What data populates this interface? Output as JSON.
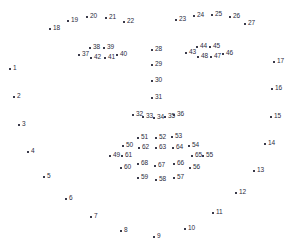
{
  "figure": {
    "width": 298,
    "height": 252,
    "background_color": "#ffffff",
    "marker_color": "#3a3a4a",
    "label_color": "#2b2b3d",
    "marker_glyph": "plus-marker"
  },
  "chart_data": {
    "type": "scatter",
    "xlabel": "",
    "ylabel": "",
    "grid": false,
    "legend": false,
    "xlim": [
      0,
      298
    ],
    "ylim": [
      0,
      252
    ],
    "groups": [
      {
        "name": "jaw-contour",
        "range": "1-17"
      },
      {
        "name": "left-eyebrow",
        "range": "18-22"
      },
      {
        "name": "right-eyebrow",
        "range": "23-27"
      },
      {
        "name": "nose-bridge",
        "range": "28-31"
      },
      {
        "name": "nose-base",
        "range": "32-36"
      },
      {
        "name": "left-eye",
        "range": "37-42"
      },
      {
        "name": "right-eye",
        "range": "43-48"
      },
      {
        "name": "outer-lip",
        "range": "49-60"
      },
      {
        "name": "inner-lip",
        "range": "61-68"
      }
    ],
    "points": [
      {
        "label": "1",
        "x": 10,
        "y": 69,
        "group": "jaw-contour"
      },
      {
        "label": "2",
        "x": 14,
        "y": 97,
        "group": "jaw-contour"
      },
      {
        "label": "3",
        "x": 19,
        "y": 125,
        "group": "jaw-contour"
      },
      {
        "label": "4",
        "x": 28,
        "y": 152,
        "group": "jaw-contour"
      },
      {
        "label": "5",
        "x": 44,
        "y": 177,
        "group": "jaw-contour"
      },
      {
        "label": "6",
        "x": 66,
        "y": 199,
        "group": "jaw-contour"
      },
      {
        "label": "7",
        "x": 91,
        "y": 217,
        "group": "jaw-contour"
      },
      {
        "label": "8",
        "x": 121,
        "y": 231,
        "group": "jaw-contour"
      },
      {
        "label": "9",
        "x": 154,
        "y": 237,
        "group": "jaw-contour"
      },
      {
        "label": "10",
        "x": 185,
        "y": 229,
        "group": "jaw-contour"
      },
      {
        "label": "11",
        "x": 213,
        "y": 213,
        "group": "jaw-contour"
      },
      {
        "label": "12",
        "x": 236,
        "y": 193,
        "group": "jaw-contour"
      },
      {
        "label": "13",
        "x": 254,
        "y": 171,
        "group": "jaw-contour"
      },
      {
        "label": "14",
        "x": 265,
        "y": 144,
        "group": "jaw-contour"
      },
      {
        "label": "15",
        "x": 271,
        "y": 117,
        "group": "jaw-contour"
      },
      {
        "label": "16",
        "x": 272,
        "y": 89,
        "group": "jaw-contour"
      },
      {
        "label": "17",
        "x": 274,
        "y": 62,
        "group": "jaw-contour"
      },
      {
        "label": "18",
        "x": 50,
        "y": 29,
        "group": "left-eyebrow"
      },
      {
        "label": "19",
        "x": 68,
        "y": 21,
        "group": "left-eyebrow"
      },
      {
        "label": "20",
        "x": 87,
        "y": 17,
        "group": "left-eyebrow"
      },
      {
        "label": "21",
        "x": 106,
        "y": 18,
        "group": "left-eyebrow"
      },
      {
        "label": "22",
        "x": 124,
        "y": 22,
        "group": "left-eyebrow"
      },
      {
        "label": "23",
        "x": 176,
        "y": 20,
        "group": "right-eyebrow"
      },
      {
        "label": "24",
        "x": 194,
        "y": 16,
        "group": "right-eyebrow"
      },
      {
        "label": "25",
        "x": 212,
        "y": 15,
        "group": "right-eyebrow"
      },
      {
        "label": "26",
        "x": 230,
        "y": 17,
        "group": "right-eyebrow"
      },
      {
        "label": "27",
        "x": 245,
        "y": 24,
        "group": "right-eyebrow"
      },
      {
        "label": "28",
        "x": 152,
        "y": 50,
        "group": "nose-bridge"
      },
      {
        "label": "29",
        "x": 152,
        "y": 65,
        "group": "nose-bridge"
      },
      {
        "label": "30",
        "x": 152,
        "y": 81,
        "group": "nose-bridge"
      },
      {
        "label": "31",
        "x": 152,
        "y": 98,
        "group": "nose-bridge"
      },
      {
        "label": "32",
        "x": 133,
        "y": 115,
        "group": "nose-base"
      },
      {
        "label": "33",
        "x": 143,
        "y": 117,
        "group": "nose-base"
      },
      {
        "label": "34",
        "x": 154,
        "y": 118,
        "group": "nose-base"
      },
      {
        "label": "35",
        "x": 165,
        "y": 117,
        "group": "nose-base"
      },
      {
        "label": "36",
        "x": 174,
        "y": 115,
        "group": "nose-base"
      },
      {
        "label": "37",
        "x": 79,
        "y": 55,
        "group": "left-eye"
      },
      {
        "label": "38",
        "x": 90,
        "y": 48,
        "group": "left-eye"
      },
      {
        "label": "39",
        "x": 104,
        "y": 48,
        "group": "left-eye"
      },
      {
        "label": "40",
        "x": 117,
        "y": 55,
        "group": "left-eye"
      },
      {
        "label": "41",
        "x": 105,
        "y": 58,
        "group": "left-eye"
      },
      {
        "label": "42",
        "x": 91,
        "y": 58,
        "group": "left-eye"
      },
      {
        "label": "43",
        "x": 186,
        "y": 53,
        "group": "right-eye"
      },
      {
        "label": "44",
        "x": 197,
        "y": 47,
        "group": "right-eye"
      },
      {
        "label": "45",
        "x": 210,
        "y": 47,
        "group": "right-eye"
      },
      {
        "label": "46",
        "x": 223,
        "y": 54,
        "group": "right-eye"
      },
      {
        "label": "47",
        "x": 211,
        "y": 57,
        "group": "right-eye"
      },
      {
        "label": "48",
        "x": 198,
        "y": 57,
        "group": "right-eye"
      },
      {
        "label": "49",
        "x": 110,
        "y": 156,
        "group": "outer-lip"
      },
      {
        "label": "50",
        "x": 123,
        "y": 146,
        "group": "outer-lip"
      },
      {
        "label": "51",
        "x": 138,
        "y": 138,
        "group": "outer-lip"
      },
      {
        "label": "52",
        "x": 156,
        "y": 138,
        "group": "outer-lip"
      },
      {
        "label": "53",
        "x": 172,
        "y": 137,
        "group": "outer-lip"
      },
      {
        "label": "54",
        "x": 189,
        "y": 146,
        "group": "outer-lip"
      },
      {
        "label": "55",
        "x": 203,
        "y": 156,
        "group": "outer-lip"
      },
      {
        "label": "56",
        "x": 190,
        "y": 168,
        "group": "outer-lip"
      },
      {
        "label": "57",
        "x": 174,
        "y": 178,
        "group": "outer-lip"
      },
      {
        "label": "58",
        "x": 156,
        "y": 180,
        "group": "outer-lip"
      },
      {
        "label": "59",
        "x": 138,
        "y": 178,
        "group": "outer-lip"
      },
      {
        "label": "60",
        "x": 121,
        "y": 168,
        "group": "outer-lip"
      },
      {
        "label": "61",
        "x": 122,
        "y": 156,
        "group": "inner-lip"
      },
      {
        "label": "62",
        "x": 139,
        "y": 148,
        "group": "inner-lip"
      },
      {
        "label": "63",
        "x": 156,
        "y": 148,
        "group": "inner-lip"
      },
      {
        "label": "64",
        "x": 173,
        "y": 148,
        "group": "inner-lip"
      },
      {
        "label": "65",
        "x": 192,
        "y": 156,
        "group": "inner-lip"
      },
      {
        "label": "66",
        "x": 174,
        "y": 164,
        "group": "inner-lip"
      },
      {
        "label": "67",
        "x": 155,
        "y": 166,
        "group": "inner-lip"
      },
      {
        "label": "68",
        "x": 138,
        "y": 164,
        "group": "inner-lip"
      }
    ]
  }
}
